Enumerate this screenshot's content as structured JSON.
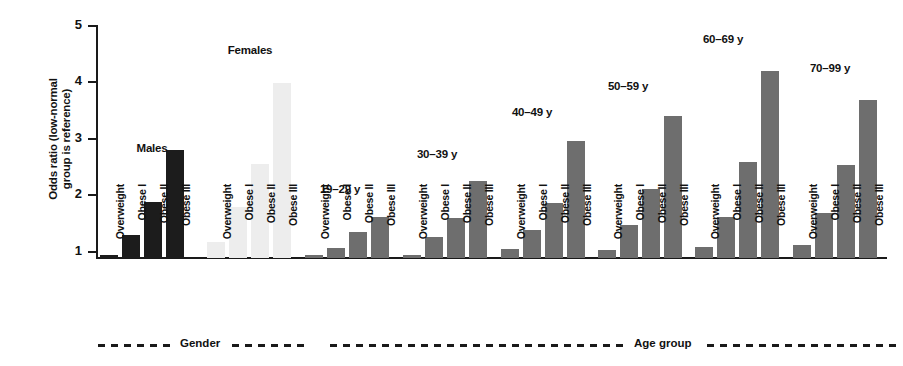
{
  "chart_data": {
    "type": "bar",
    "title": "",
    "xlabel": "",
    "ylabel": "Odds ratio (low-normal group is reference)",
    "ylabel_line1": "Odds ratio (low-normal",
    "ylabel_line2": "group is reference)",
    "ylim": [
      1,
      5
    ],
    "yticks": [
      1,
      2,
      3,
      4,
      5
    ],
    "ytick_labels": [
      "1",
      "2",
      "3",
      "4",
      "5"
    ],
    "grid": false,
    "legend": "none",
    "categories": [
      "Overweight",
      "Obese I",
      "Obese II",
      "Obese III"
    ],
    "series": [
      {
        "name": "Males",
        "panel": "Gender",
        "color": "#1c1c1c",
        "values": [
          1.06,
          1.4,
          1.98,
          2.9
        ]
      },
      {
        "name": "Females",
        "panel": "Gender",
        "color": "#ededed",
        "values": [
          1.28,
          1.9,
          2.65,
          4.08
        ]
      },
      {
        "name": "19-29 y",
        "panel": "Age group",
        "color": "#6e6e6e",
        "values": [
          1.05,
          1.18,
          1.46,
          1.72
        ]
      },
      {
        "name": "30-39 y",
        "panel": "Age group",
        "color": "#6e6e6e",
        "values": [
          1.06,
          1.37,
          1.7,
          2.35
        ]
      },
      {
        "name": "40-49 y",
        "panel": "Age group",
        "color": "#6e6e6e",
        "values": [
          1.16,
          1.5,
          1.97,
          3.07
        ]
      },
      {
        "name": "50-59 y",
        "panel": "Age group",
        "color": "#6e6e6e",
        "values": [
          1.15,
          1.58,
          2.21,
          3.51
        ]
      },
      {
        "name": "60-69 y",
        "panel": "Age group",
        "color": "#6e6e6e",
        "values": [
          1.2,
          1.73,
          2.69,
          4.3
        ]
      },
      {
        "name": "70-99 y",
        "panel": "Age group",
        "color": "#6e6e6e",
        "values": [
          1.23,
          1.79,
          2.64,
          3.78
        ]
      }
    ],
    "panels": [
      {
        "label": "Gender",
        "groups": [
          "Males",
          "Females"
        ]
      },
      {
        "label": "Age group",
        "groups": [
          "19-29 y",
          "30-39 y",
          "40-49 y",
          "50-59 y",
          "60-69 y",
          "70-99 y"
        ]
      }
    ]
  },
  "axis": {
    "t1": "1",
    "t2": "2",
    "t3": "3",
    "t4": "4",
    "t5": "5"
  },
  "group_titles": {
    "males": "Males",
    "females": "Females",
    "a19": "19–29 y",
    "a30": "30–39 y",
    "a40": "40–49 y",
    "a50": "50–59 y",
    "a60": "60–69 y",
    "a70": "70–99 y"
  },
  "cat_labels": {
    "overweight": "Overweight",
    "obese1": "Obese I",
    "obese2": "Obese II",
    "obese3": "Obese III"
  },
  "brackets": {
    "gender": "Gender",
    "agegroup": "Age group"
  }
}
